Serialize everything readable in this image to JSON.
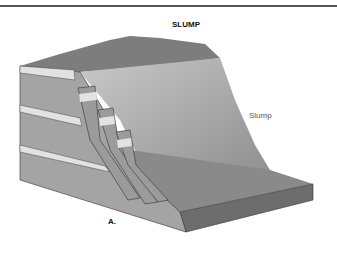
{
  "figure": {
    "title": "SLUMP",
    "callout_label": "Slump",
    "panel_label": "A."
  }
}
